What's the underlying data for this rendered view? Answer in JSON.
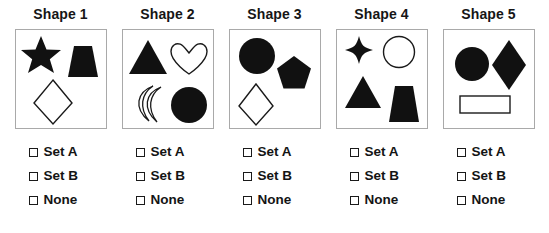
{
  "worksheet": {
    "title_prefix": "Shape",
    "columns": [
      {
        "title": "Shape 1",
        "shapes": [
          {
            "name": "five-pointed-star",
            "fill": "filled"
          },
          {
            "name": "trapezoid",
            "fill": "filled"
          },
          {
            "name": "diamond",
            "fill": "outline"
          }
        ],
        "options": [
          {
            "label": "Set A",
            "checked": false
          },
          {
            "label": "Set B",
            "checked": false
          },
          {
            "label": "None",
            "checked": false
          }
        ]
      },
      {
        "title": "Shape 2",
        "shapes": [
          {
            "name": "triangle",
            "fill": "filled"
          },
          {
            "name": "heart",
            "fill": "outline"
          },
          {
            "name": "crescent-moon",
            "fill": "outline"
          },
          {
            "name": "circle",
            "fill": "filled"
          }
        ],
        "options": [
          {
            "label": "Set A",
            "checked": false
          },
          {
            "label": "Set B",
            "checked": false
          },
          {
            "label": "None",
            "checked": false
          }
        ]
      },
      {
        "title": "Shape 3",
        "shapes": [
          {
            "name": "circle",
            "fill": "filled"
          },
          {
            "name": "pentagon",
            "fill": "filled"
          },
          {
            "name": "diamond",
            "fill": "outline"
          }
        ],
        "options": [
          {
            "label": "Set A",
            "checked": false
          },
          {
            "label": "Set B",
            "checked": false
          },
          {
            "label": "None",
            "checked": false
          }
        ]
      },
      {
        "title": "Shape 4",
        "shapes": [
          {
            "name": "four-pointed-star",
            "fill": "filled"
          },
          {
            "name": "circle",
            "fill": "outline"
          },
          {
            "name": "triangle",
            "fill": "filled"
          },
          {
            "name": "trapezoid",
            "fill": "filled"
          }
        ],
        "options": [
          {
            "label": "Set A",
            "checked": false
          },
          {
            "label": "Set B",
            "checked": false
          },
          {
            "label": "None",
            "checked": false
          }
        ]
      },
      {
        "title": "Shape 5",
        "shapes": [
          {
            "name": "circle",
            "fill": "filled"
          },
          {
            "name": "diamond",
            "fill": "filled"
          },
          {
            "name": "rectangle",
            "fill": "outline"
          }
        ],
        "options": [
          {
            "label": "Set A",
            "checked": false
          },
          {
            "label": "Set B",
            "checked": false
          },
          {
            "label": "None",
            "checked": false
          }
        ]
      }
    ],
    "colors": {
      "shape_fill": "#111111",
      "shape_stroke": "#1a1a1a",
      "box_border": "#a9a9a9",
      "text": "#161616",
      "background": "#ffffff"
    }
  }
}
